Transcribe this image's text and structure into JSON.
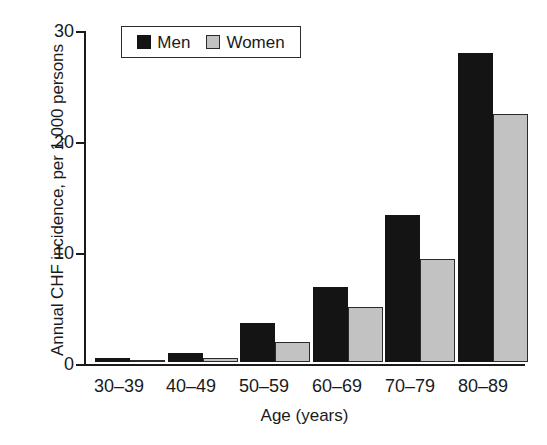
{
  "chart_data": {
    "type": "bar",
    "title": "",
    "xlabel": "Age (years)",
    "ylabel": "Annual CHF incidence, per 1,000 persons",
    "categories": [
      "30–39",
      "40–49",
      "50–59",
      "60–69",
      "70–79",
      "80–89"
    ],
    "series": [
      {
        "name": "Men",
        "color": "#141414",
        "values": [
          0.4,
          0.8,
          3.5,
          6.8,
          13.2,
          27.8
        ]
      },
      {
        "name": "Women",
        "color": "#c2c2c2",
        "values": [
          0.2,
          0.4,
          1.8,
          5.0,
          9.3,
          22.3
        ]
      }
    ],
    "ylim": [
      0,
      30
    ],
    "yticks": [
      0,
      10,
      20,
      30
    ],
    "ytick_labels": [
      "0",
      "10",
      "20",
      "30"
    ],
    "grid": false,
    "legend_position": "top-left-inside"
  },
  "legend": {
    "men_label": "Men",
    "women_label": "Women"
  },
  "axes": {
    "y_title": "Annual CHF incidence, per 1,000 persons",
    "x_title": "Age (years)",
    "ytick_0": "0",
    "ytick_1": "10",
    "ytick_2": "20",
    "ytick_3": "30",
    "xtick_0": "30–39",
    "xtick_1": "40–49",
    "xtick_2": "50–59",
    "xtick_3": "60–69",
    "xtick_4": "70–79",
    "xtick_5": "80–89"
  }
}
